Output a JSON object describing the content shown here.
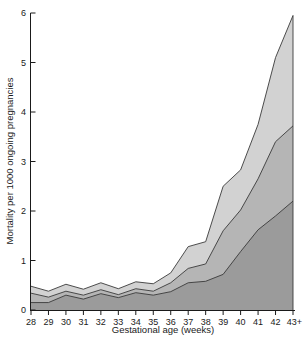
{
  "chart_data": {
    "type": "area",
    "title": "",
    "xlabel": "Gestational age (weeks)",
    "ylabel": "Mortality per 1000 ongoing pregnancies",
    "x_tick_labels": [
      "28",
      "29",
      "30",
      "31",
      "32",
      "33",
      "34",
      "35",
      "36",
      "37",
      "38",
      "39",
      "40",
      "41",
      "42",
      "43+"
    ],
    "x_values": [
      28,
      29,
      30,
      31,
      32,
      33,
      34,
      35,
      36,
      37,
      38,
      39,
      40,
      41,
      42,
      43
    ],
    "y_ticks": [
      0,
      1,
      2,
      3,
      4,
      5,
      6
    ],
    "ylim": [
      0,
      6
    ],
    "grid": false,
    "legend": "none",
    "note": "three overlapping gray bands; values are each band's upper boundary in deaths per 1000 ongoing pregnancies",
    "series": [
      {
        "name": "light-gray-band-top-boundary",
        "color": "#d2d2d2",
        "values": [
          0.48,
          0.38,
          0.52,
          0.42,
          0.55,
          0.43,
          0.57,
          0.53,
          0.75,
          1.28,
          1.38,
          2.5,
          2.83,
          3.75,
          5.1,
          5.95
        ]
      },
      {
        "name": "medium-gray-band-top-boundary",
        "color": "#b5b5b5",
        "values": [
          0.34,
          0.26,
          0.38,
          0.3,
          0.41,
          0.31,
          0.43,
          0.38,
          0.55,
          0.84,
          0.93,
          1.6,
          2.02,
          2.65,
          3.4,
          3.72
        ]
      },
      {
        "name": "dark-gray-band-top-boundary",
        "color": "#9b9b9b",
        "values": [
          0.15,
          0.15,
          0.3,
          0.22,
          0.33,
          0.25,
          0.35,
          0.3,
          0.37,
          0.55,
          0.58,
          0.72,
          1.18,
          1.62,
          1.9,
          2.2
        ]
      }
    ],
    "line_color": "#3a3a3a",
    "axis_color": "#1a1a1a"
  },
  "layout": {
    "plot": {
      "left": 31,
      "right": 293,
      "bottom": 310,
      "top": 13
    }
  }
}
